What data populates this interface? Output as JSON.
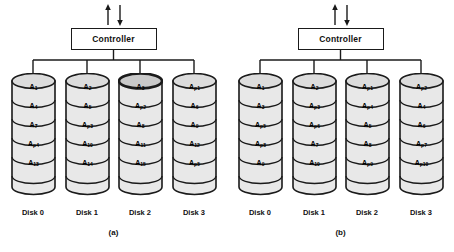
{
  "figure": {
    "width": 454,
    "height": 252,
    "background": "#ffffff",
    "line_color": "#1a1a1a",
    "cylinder_fill": "#e8e8e8",
    "cylinder_top_fill": "#dcdcdc"
  },
  "panels": [
    {
      "id": "a",
      "label": "(a)",
      "controller": {
        "label": "Controller",
        "arrow_up": "arrow-up-icon",
        "arrow_down": "arrow-down-icon"
      },
      "disks": [
        {
          "caption": "Disk 0",
          "blocks": [
            {
              "base": "A",
              "sub": "1"
            },
            {
              "base": "A",
              "sub": "4"
            },
            {
              "base": "A",
              "sub": "7"
            },
            {
              "base": "A",
              "sub": "p4"
            },
            {
              "base": "A",
              "sub": "13"
            }
          ]
        },
        {
          "caption": "Disk 1",
          "blocks": [
            {
              "base": "A",
              "sub": "2"
            },
            {
              "base": "A",
              "sub": "5"
            },
            {
              "base": "A",
              "sub": "p3"
            },
            {
              "base": "A",
              "sub": "10"
            },
            {
              "base": "A",
              "sub": "14"
            }
          ]
        },
        {
          "caption": "Disk 2",
          "blocks": [
            {
              "base": "A",
              "sub": "3"
            },
            {
              "base": "A",
              "sub": "p2"
            },
            {
              "base": "A",
              "sub": "8"
            },
            {
              "base": "A",
              "sub": "11"
            },
            {
              "base": "A",
              "sub": "15"
            }
          ]
        },
        {
          "caption": "Disk 3",
          "blocks": [
            {
              "base": "A",
              "sub": "p1"
            },
            {
              "base": "A",
              "sub": "6"
            },
            {
              "base": "A",
              "sub": "9"
            },
            {
              "base": "A",
              "sub": "12"
            },
            {
              "base": "A",
              "sub": "p5"
            }
          ]
        }
      ]
    },
    {
      "id": "b",
      "label": "(b)",
      "controller": {
        "label": "Controller",
        "arrow_up": "arrow-up-icon",
        "arrow_down": "arrow-down-icon"
      },
      "disks": [
        {
          "caption": "Disk 0",
          "blocks": [
            {
              "base": "A",
              "sub": "1"
            },
            {
              "base": "A",
              "sub": "3"
            },
            {
              "base": "A",
              "sub": "p5"
            },
            {
              "base": "A",
              "sub": "p8"
            },
            {
              "base": "A",
              "sub": "9"
            }
          ]
        },
        {
          "caption": "Disk 1",
          "blocks": [
            {
              "base": "A",
              "sub": "2"
            },
            {
              "base": "A",
              "sub": "p3"
            },
            {
              "base": "A",
              "sub": "p6"
            },
            {
              "base": "A",
              "sub": "7"
            },
            {
              "base": "A",
              "sub": "10"
            }
          ]
        },
        {
          "caption": "Disk 2",
          "blocks": [
            {
              "base": "A",
              "sub": "p1"
            },
            {
              "base": "A",
              "sub": "p4"
            },
            {
              "base": "A",
              "sub": "5"
            },
            {
              "base": "A",
              "sub": "8"
            },
            {
              "base": "A",
              "sub": "p9"
            }
          ]
        },
        {
          "caption": "Disk 3",
          "blocks": [
            {
              "base": "A",
              "sub": "p2"
            },
            {
              "base": "A",
              "sub": "4"
            },
            {
              "base": "A",
              "sub": "6"
            },
            {
              "base": "A",
              "sub": "p7"
            },
            {
              "base": "A",
              "sub": "p10"
            }
          ]
        }
      ]
    }
  ]
}
